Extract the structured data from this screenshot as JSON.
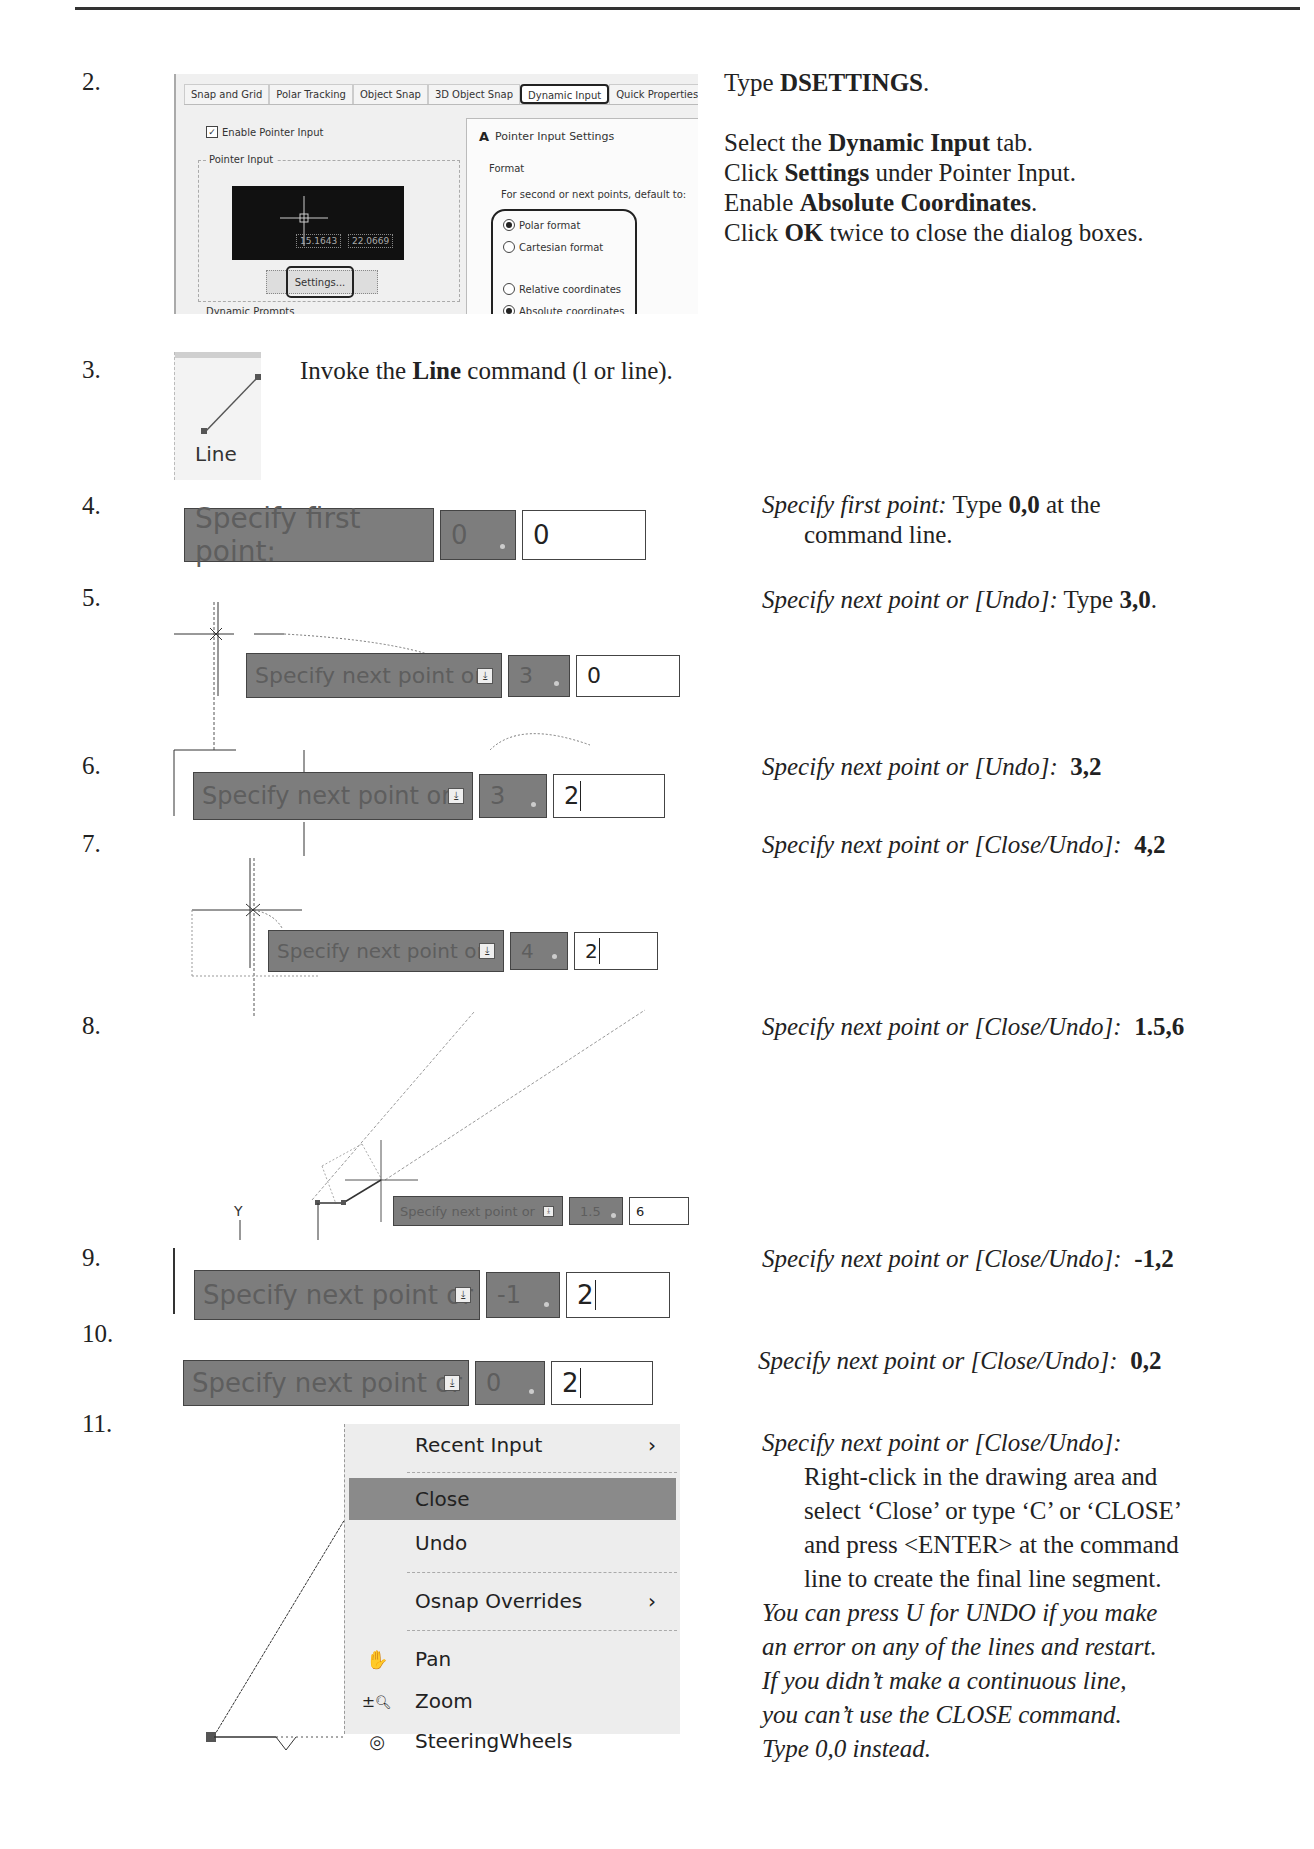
{
  "steps": [
    {
      "number": "2."
    },
    {
      "number": "3."
    },
    {
      "number": "4."
    },
    {
      "number": "5."
    },
    {
      "number": "6."
    },
    {
      "number": "7."
    },
    {
      "number": "8."
    },
    {
      "number": "9."
    },
    {
      "number": "10."
    },
    {
      "number": "11."
    }
  ],
  "step2": {
    "dialog": {
      "tabs": [
        "Snap and Grid",
        "Polar Tracking",
        "Object Snap",
        "3D Object Snap",
        "Dynamic Input",
        "Quick Properties",
        "Sele"
      ],
      "active_tab": "Dynamic Input",
      "enable_pointer_input": "Enable Pointer Input",
      "pointer_input_group": "Pointer Input",
      "preview_x": "15.1643",
      "preview_y": "22.0669",
      "settings_button": "Settings...",
      "dynamic_prompts_group": "Dynamic Prompts",
      "sub_dialog": {
        "icon": "A",
        "title": "Pointer Input Settings",
        "format_label": "Format",
        "format_question": "For second or next points, default to:",
        "options": [
          {
            "label": "Polar format",
            "selected": true
          },
          {
            "label": "Cartesian format",
            "selected": false
          },
          {
            "label": "Relative coordinates",
            "selected": false
          },
          {
            "label": "Absolute coordinates",
            "selected": true
          }
        ]
      }
    },
    "instructions": {
      "line1_pre": "Type ",
      "line1_bold": "DSETTINGS",
      "line1_post": ".",
      "line2_pre": "Select the ",
      "line2_bold": "Dynamic Input",
      "line2_post": " tab.",
      "line3_pre": "Click ",
      "line3_bold": "Settings",
      "line3_post": " under Pointer Input.",
      "line4_pre": "Enable ",
      "line4_bold": "Absolute Coordinates",
      "line4_post": ".",
      "line5_pre": "Click ",
      "line5_bold": "OK",
      "line5_post": " twice to close the dialog boxes."
    }
  },
  "step3": {
    "button_label": "Line",
    "text_pre": "Invoke the ",
    "text_bold": "Line",
    "text_post": " command (l or line)."
  },
  "step4": {
    "prompt": "Specify first point:",
    "x_value": "0",
    "y_value": "0",
    "inst_italic": "Specify first point:",
    "inst_pre": "  Type ",
    "inst_bold": "0,0",
    "inst_post": " at the",
    "inst_line2": "command line."
  },
  "step5": {
    "prompt": "Specify next point or",
    "x_value": "3",
    "y_value": "0",
    "inst_italic": "Specify next point or [Undo]:",
    "inst_pre": "  Type ",
    "inst_bold": "3,0",
    "inst_post": "."
  },
  "step6": {
    "prompt": "Specify next point or",
    "x_value": "3",
    "y_value": "2",
    "inst_italic": "Specify next point or [Undo]:",
    "inst_bold": "3,2"
  },
  "step7": {
    "prompt": "Specify next point or",
    "x_value": "4",
    "y_value": "2",
    "inst_italic": "Specify next point or [Close/Undo]:",
    "inst_bold": "4,2"
  },
  "step8": {
    "prompt": "Specify next point or",
    "x_value": "1.5",
    "y_value": "6",
    "axis_label": "Y",
    "inst_italic": "Specify next point or [Close/Undo]:",
    "inst_bold": "1.5,6"
  },
  "step9": {
    "prompt": "Specify next point or",
    "x_value": "-1",
    "y_value": "2",
    "inst_italic": "Specify next point or [Close/Undo]:",
    "inst_bold": "-1,2"
  },
  "step10": {
    "prompt": "Specify next point or",
    "x_value": "0",
    "y_value": "2",
    "inst_italic": "Specify next point or [Close/Undo]:",
    "inst_bold": "0,2"
  },
  "step11": {
    "menu": [
      {
        "label": "Recent Input",
        "submenu": true,
        "icon": ""
      },
      {
        "label": "Close",
        "submenu": false,
        "icon": "",
        "highlighted": true
      },
      {
        "label": "Undo",
        "submenu": false,
        "icon": ""
      },
      {
        "label": "Osnap Overrides",
        "submenu": true,
        "icon": ""
      },
      {
        "label": "Pan",
        "submenu": false,
        "icon": "hand-icon"
      },
      {
        "label": "Zoom",
        "submenu": false,
        "icon": "zoom-icon"
      },
      {
        "label": "SteeringWheels",
        "submenu": false,
        "icon": "steering-wheel-icon"
      }
    ],
    "submenu_arrow": "›",
    "inst_italic": "Specify next point or [Close/Undo]:",
    "inst_lines": [
      "Right-click in the drawing area and",
      "select ‘Close’ or type ‘C’ or ‘CLOSE’",
      "and press <ENTER> at the command",
      "line to create the final line segment."
    ],
    "note_lines": [
      "You can press U for UNDO if you make",
      "an error on any of the lines and restart.",
      "If you didn’t make a continuous line,",
      "you can’t use the CLOSE command.",
      "Type 0,0 instead."
    ]
  }
}
